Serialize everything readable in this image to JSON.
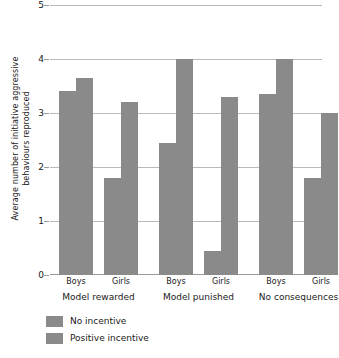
{
  "chart_data": {
    "type": "bar",
    "title": "",
    "xlabel": "",
    "ylabel": "Average number of initiative aggressive\nbehaviours reproduced",
    "ylim": [
      0,
      5
    ],
    "yticks": [
      0,
      1,
      2,
      3,
      4,
      5
    ],
    "ytick_labels": [
      "0",
      "1",
      "2",
      "3",
      "4",
      "5"
    ],
    "grid": true,
    "legend_position": "below-left",
    "categories": [
      "Boys",
      "Girls",
      "Boys",
      "Girls",
      "Boys",
      "Girls"
    ],
    "groups": [
      "Model rewarded",
      "Model punished",
      "No consequences"
    ],
    "subcategories": [
      "Boys",
      "Girls"
    ],
    "series": [
      {
        "name": "No incentive",
        "color": "#8a8a8a",
        "values": [
          3.4,
          1.8,
          2.45,
          0.45,
          3.35,
          1.8
        ]
      },
      {
        "name": "Positive incentive",
        "color": "#8a8a8a",
        "values": [
          3.65,
          3.2,
          4.0,
          3.3,
          4.0,
          3.0
        ]
      }
    ],
    "bars": [
      {
        "group": "Model rewarded",
        "sex": "Boys",
        "series": "No incentive",
        "value": 3.4
      },
      {
        "group": "Model rewarded",
        "sex": "Boys",
        "series": "Positive incentive",
        "value": 3.65
      },
      {
        "group": "Model rewarded",
        "sex": "Girls",
        "series": "No incentive",
        "value": 1.8
      },
      {
        "group": "Model rewarded",
        "sex": "Girls",
        "series": "Positive incentive",
        "value": 3.2
      },
      {
        "group": "Model punished",
        "sex": "Boys",
        "series": "No incentive",
        "value": 2.45
      },
      {
        "group": "Model punished",
        "sex": "Boys",
        "series": "Positive incentive",
        "value": 4.0
      },
      {
        "group": "Model punished",
        "sex": "Girls",
        "series": "No incentive",
        "value": 0.45
      },
      {
        "group": "Model punished",
        "sex": "Girls",
        "series": "Positive incentive",
        "value": 3.3
      },
      {
        "group": "No consequences",
        "sex": "Boys",
        "series": "No incentive",
        "value": 3.35
      },
      {
        "group": "No consequences",
        "sex": "Boys",
        "series": "Positive incentive",
        "value": 4.0
      },
      {
        "group": "No consequences",
        "sex": "Girls",
        "series": "No incentive",
        "value": 1.8
      },
      {
        "group": "No consequences",
        "sex": "Girls",
        "series": "Positive incentive",
        "value": 3.0
      }
    ]
  },
  "legend": {
    "items": [
      {
        "label": "No incentive",
        "color": "#8a8a8a"
      },
      {
        "label": "Positive incentive",
        "color": "#8a8a8a"
      }
    ]
  },
  "axis": {
    "y_title_line1": "Average number of initiative aggressive",
    "y_title_line2": "behaviours reproduced"
  },
  "colors": {
    "bar": "#8a8a8a",
    "grid": "#b9b9b9",
    "axis": "#9a9a9a",
    "text": "#1a1a1a",
    "background": "#ffffff"
  }
}
